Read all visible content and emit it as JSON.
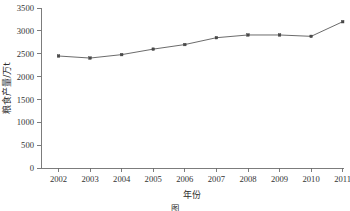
{
  "chart_data": {
    "type": "line",
    "title": "",
    "xlabel": "年份",
    "ylabel": "粮食产量/万t",
    "categories": [
      "2002",
      "2003",
      "2004",
      "2005",
      "2006",
      "2007",
      "2008",
      "2009",
      "2010",
      "2011"
    ],
    "x": [
      2002,
      2003,
      2004,
      2005,
      2006,
      2007,
      2008,
      2009,
      2010,
      2011
    ],
    "values": [
      2450,
      2405,
      2480,
      2600,
      2700,
      2850,
      2910,
      2910,
      2880,
      3200
    ],
    "series": [
      {
        "name": "粮食产量",
        "values": [
          2450,
          2405,
          2480,
          2600,
          2700,
          2850,
          2910,
          2910,
          2880,
          3200
        ]
      }
    ],
    "ylim": [
      0,
      3500
    ],
    "yticks": [
      0,
      500,
      1000,
      1500,
      2000,
      2500,
      3000,
      3500
    ],
    "ytick_labels": [
      "0",
      "500",
      "1000",
      "1500",
      "2000",
      "2500",
      "3000",
      "3500"
    ],
    "xlim": [
      2002,
      2011
    ],
    "grid": false,
    "legend": false,
    "legend_position": "none",
    "marker": "square",
    "line_color": "#5a5a5a",
    "marker_color": "#4a4a4a"
  },
  "caption": {
    "text": "图",
    "visible": false
  },
  "axes": {
    "x_axis_title": "年份",
    "y_axis_title": "粮食产量/万t"
  }
}
